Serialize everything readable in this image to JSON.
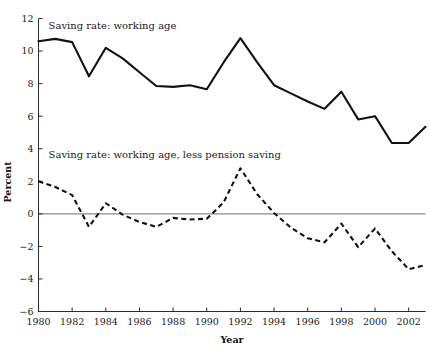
{
  "chart_data": {
    "type": "line",
    "title": "",
    "subtitle": "",
    "xlabel": "Year",
    "ylabel": "Percent",
    "xlim": [
      1980,
      2003
    ],
    "ylim": [
      -6,
      12
    ],
    "grid": false,
    "legend_position": "inline-annotation",
    "x": [
      1980,
      1981,
      1982,
      1983,
      1984,
      1985,
      1986,
      1987,
      1988,
      1989,
      1990,
      1991,
      1992,
      1993,
      1994,
      1995,
      1996,
      1997,
      1998,
      1999,
      2000,
      2001,
      2002,
      2003
    ],
    "xticks": [
      1980,
      1982,
      1984,
      1986,
      1988,
      1990,
      1992,
      1994,
      1996,
      1998,
      2000,
      2002
    ],
    "xtick_labels": [
      "1980",
      "1982",
      "1984",
      "1986",
      "1988",
      "1990",
      "1992",
      "1994",
      "1996",
      "1998",
      "2000",
      "2002"
    ],
    "yticks": [
      -6,
      -4,
      -2,
      0,
      2,
      4,
      6,
      8,
      10,
      12
    ],
    "ytick_labels": [
      "−6",
      "−4",
      "−2",
      "0",
      "2",
      "4",
      "6",
      "8",
      "10",
      "12"
    ],
    "zero_line": 0,
    "series": [
      {
        "name": "Saving rate: working age",
        "style": "solid",
        "annotation": "Saving rate: working age",
        "annotation_x": 1980.6,
        "annotation_y": 11.35,
        "values": [
          10.6,
          10.75,
          10.55,
          8.45,
          10.2,
          9.55,
          8.7,
          7.85,
          7.8,
          7.9,
          7.65,
          9.3,
          10.8,
          9.3,
          7.9,
          7.4,
          6.9,
          6.45,
          7.5,
          5.8,
          6.0,
          4.35,
          4.35,
          5.35
        ]
      },
      {
        "name": "Saving rate: working age, less pension saving",
        "style": "dashed",
        "annotation": "Saving rate: working age, less pension saving",
        "annotation_x": 1980.6,
        "annotation_y": 3.45,
        "values": [
          2.0,
          1.65,
          1.15,
          -0.8,
          0.65,
          -0.05,
          -0.5,
          -0.8,
          -0.25,
          -0.35,
          -0.3,
          0.7,
          2.8,
          1.2,
          0.05,
          -0.85,
          -1.5,
          -1.75,
          -0.6,
          -2.05,
          -0.9,
          -2.3,
          -3.4,
          -3.15
        ]
      }
    ]
  },
  "axes": {
    "ylabel": "Percent",
    "xlabel": "Year"
  }
}
